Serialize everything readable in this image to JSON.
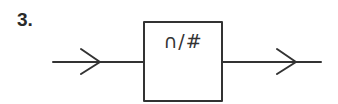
{
  "diagram": {
    "number_label": "3.",
    "block": {
      "text": "∩/#"
    },
    "colors": {
      "stroke": "#333333",
      "background": "#ffffff"
    },
    "nodes": [
      {
        "id": "block",
        "type": "rect",
        "text": "∩/#"
      }
    ],
    "edges": [
      {
        "from": "input",
        "to": "block",
        "arrow": "open-chevron"
      },
      {
        "from": "block",
        "to": "output",
        "arrow": "open-chevron"
      }
    ]
  }
}
